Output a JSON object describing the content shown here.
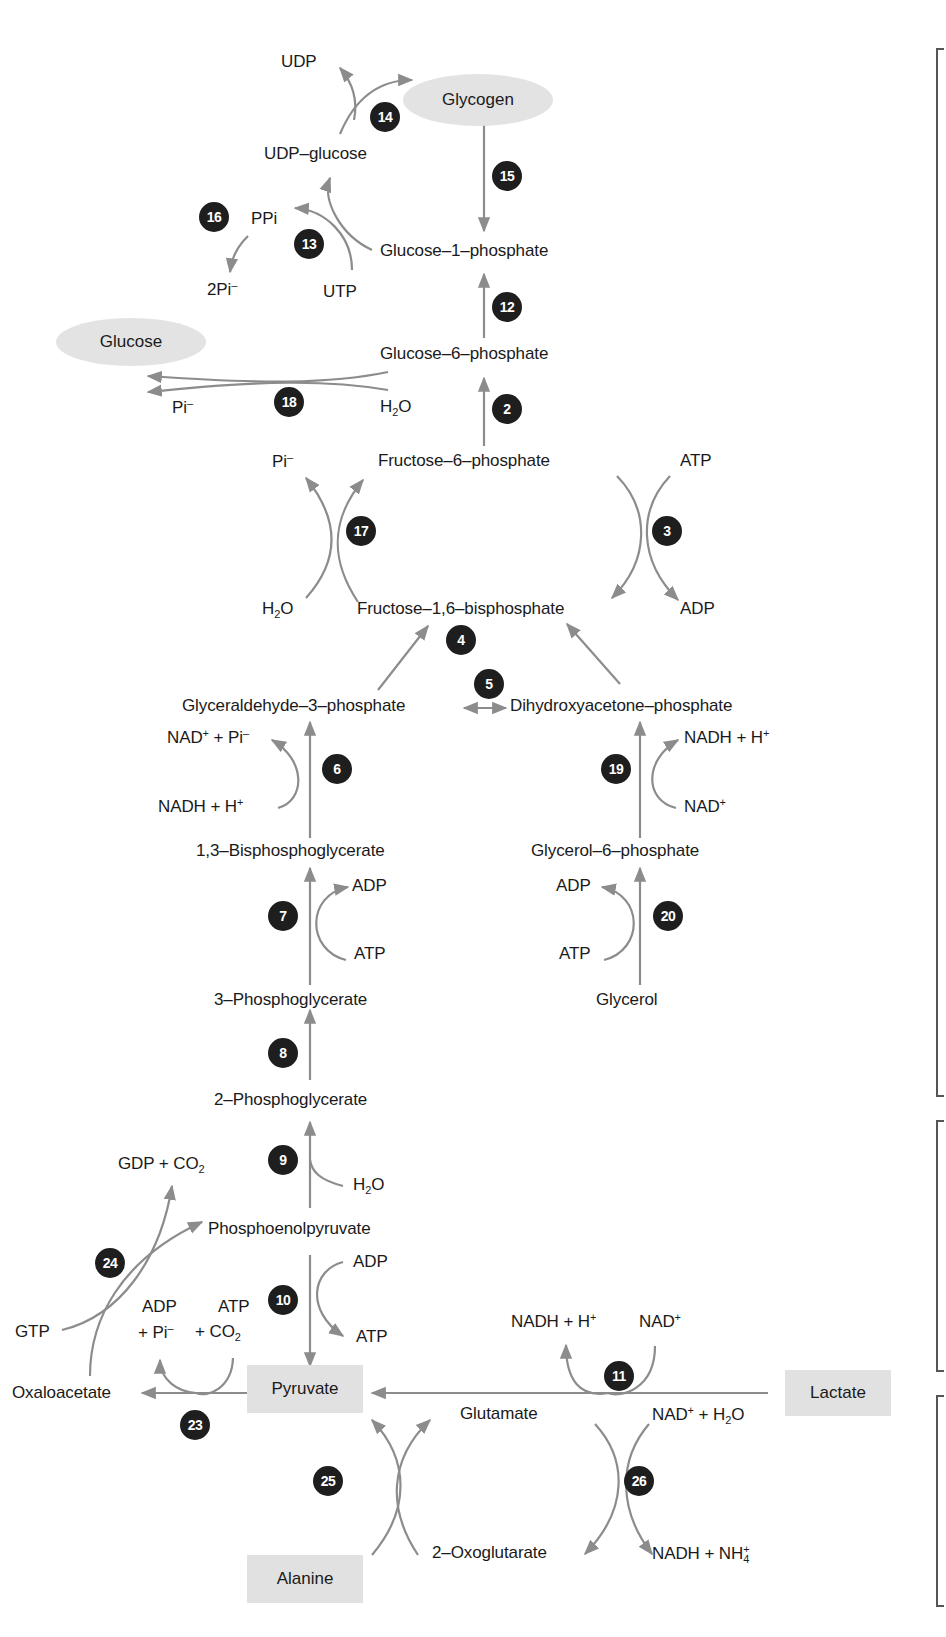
{
  "diagram": {
    "colors": {
      "arrow": "#8c8c8c",
      "badge": "#1e1e1e",
      "highlight_fill": "#e2e2e2",
      "text": "#1a1a1a",
      "bracket": "#555555"
    },
    "highlighted_nodes": {
      "glycogen": "Glycogen",
      "glucose": "Glucose",
      "pyruvate": "Pyruvate",
      "lactate": "Lactate",
      "alanine": "Alanine"
    },
    "metabolites": {
      "udp_glucose": "UDP–glucose",
      "glucose_1_phosphate": "Glucose–1–phosphate",
      "glucose_6_phosphate": "Glucose–6–phosphate",
      "fructose_6_phosphate": "Fructose–6–phosphate",
      "fructose_1_6_bisphosphate": "Fructose–1,6–bisphosphate",
      "glyceraldehyde_3_phosphate": "Glyceraldehyde–3–phosphate",
      "dihydroxyacetone_phosphate": "Dihydroxyacetone–phosphate",
      "bisphosphoglycerate_1_3": "1,3–Bisphosphoglycerate",
      "glycerol_6_phosphate": "Glycerol–6–phosphate",
      "phosphoglycerate_3": "3–Phosphoglycerate",
      "glycerol": "Glycerol",
      "phosphoglycerate_2": "2–Phosphoglycerate",
      "phosphoenolpyruvate": "Phosphoenolpyruvate",
      "oxaloacetate": "Oxaloacetate",
      "glutamate": "Glutamate",
      "oxoglutarate_2": "2–Oxoglutarate"
    },
    "cofactors": {
      "udp": "UDP",
      "ppi": "PPi",
      "two_pi": "2Pi",
      "utp": "UTP",
      "pi_18": "Pi",
      "h2o_18_a": "H",
      "h2o_18_sub": "2",
      "h2o_18_b": "O",
      "pi_17": "Pi",
      "h2o_17_a": "H",
      "h2o_17_sub": "2",
      "h2o_17_b": "O",
      "atp_3": "ATP",
      "adp_3": "ADP",
      "nad_pi_6_a": "NAD",
      "nad_pi_6_b": " + Pi",
      "nadh_6": "NADH + H",
      "nadh_19": "NADH + H",
      "nad_19": "NAD",
      "adp_7": "ADP",
      "atp_7": "ATP",
      "adp_20": "ADP",
      "atp_20": "ATP",
      "gdp_co2_a": "GDP + CO",
      "gdp_co2_sub": "2",
      "h2o_9_a": "H",
      "h2o_9_sub": "2",
      "h2o_9_b": "O",
      "adp_10": "ADP",
      "atp_10": "ATP",
      "gtp": "GTP",
      "adp_23_l1": "ADP",
      "adp_23_l2": "+ Pi",
      "atp_23_l1": "ATP",
      "atp_23_l2": "+ CO",
      "atp_23_sub": "2",
      "nadh_11": "NADH + H",
      "nad_11": "NAD",
      "nad_h2o_26_a": "NAD",
      "nad_h2o_26_b": " + H",
      "nad_h2o_26_sub": "2",
      "nad_h2o_26_c": "O",
      "nadh_nh4_26_a": "NADH + NH",
      "nadh_nh4_26_sub": "4",
      "minus": "–",
      "plus": "+"
    },
    "steps": [
      "2",
      "3",
      "4",
      "5",
      "6",
      "7",
      "8",
      "9",
      "10",
      "11",
      "12",
      "13",
      "14",
      "15",
      "16",
      "17",
      "18",
      "19",
      "20",
      "23",
      "24",
      "25",
      "26"
    ],
    "brackets": [
      {
        "top": 48,
        "bottom": 1093
      },
      {
        "top": 1120,
        "bottom": 1368
      },
      {
        "top": 1395,
        "bottom": 1603
      }
    ]
  }
}
